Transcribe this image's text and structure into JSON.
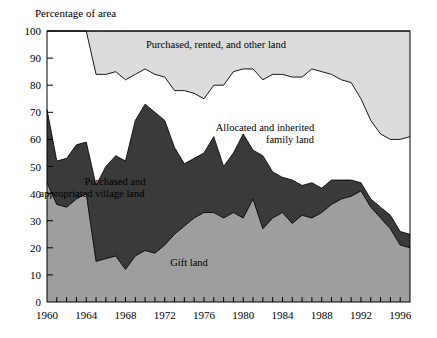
{
  "chart_data": {
    "type": "area",
    "stacked": true,
    "title": "",
    "ylabel": "Percentage of area",
    "xlabel": "",
    "ylim": [
      0,
      100
    ],
    "xlim": [
      1960,
      1997
    ],
    "grid": false,
    "legend_position": "inline-annotations",
    "y_ticks": [
      0,
      10,
      20,
      30,
      40,
      50,
      60,
      70,
      80,
      90,
      100
    ],
    "x_ticks": [
      1960,
      1964,
      1968,
      1972,
      1976,
      1980,
      1984,
      1988,
      1992,
      1996
    ],
    "x_minor_tick_interval": 1,
    "x": [
      1960,
      1961,
      1962,
      1963,
      1964,
      1965,
      1966,
      1967,
      1968,
      1969,
      1970,
      1971,
      1972,
      1973,
      1974,
      1975,
      1976,
      1977,
      1978,
      1979,
      1980,
      1981,
      1982,
      1983,
      1984,
      1985,
      1986,
      1987,
      1988,
      1989,
      1990,
      1991,
      1992,
      1993,
      1994,
      1995,
      1996,
      1997
    ],
    "series": [
      {
        "name": "Gift land",
        "key": "gift_land",
        "color": "#9e9e9e",
        "label_text": "Gift land",
        "values": [
          44,
          36,
          35,
          38,
          40,
          15,
          16,
          17,
          12,
          17,
          19,
          18,
          21,
          25,
          28,
          31,
          33,
          33,
          31,
          33,
          31,
          38,
          27,
          31,
          33,
          29,
          32,
          31,
          33,
          36,
          38,
          39,
          41,
          35,
          31,
          27,
          21,
          20
        ]
      },
      {
        "name": "Purchased and appropriated village land",
        "key": "village_land",
        "color": "#3a3a3a",
        "label_text": "Purchased and\nappropriated village land",
        "values": [
          27,
          16,
          18,
          20,
          19,
          28,
          34,
          37,
          40,
          50,
          54,
          52,
          46,
          32,
          23,
          22,
          22,
          28,
          19,
          22,
          31,
          18,
          27,
          17,
          13,
          16,
          11,
          13,
          9,
          9,
          7,
          6,
          3,
          3,
          4,
          5,
          5,
          5
        ]
      },
      {
        "name": "Allocated and inherited family land",
        "key": "family_land",
        "color": "#ffffff",
        "label_text": "Allocated and inherited\nfamily land",
        "values": [
          29,
          48,
          47,
          42,
          41,
          41,
          34,
          31,
          30,
          17,
          13,
          14,
          16,
          21,
          27,
          24,
          20,
          19,
          30,
          30,
          24,
          30,
          28,
          36,
          38,
          38,
          40,
          42,
          43,
          39,
          37,
          36,
          31,
          29,
          27,
          28,
          34,
          36
        ]
      },
      {
        "name": "Purchased, rented, and other land",
        "key": "other_land",
        "color": "#dcdcdc",
        "label_text": "Purchased, rented, and other land",
        "values": [
          0,
          0,
          0,
          0,
          0,
          16,
          16,
          15,
          18,
          16,
          14,
          16,
          17,
          22,
          22,
          23,
          25,
          20,
          20,
          15,
          14,
          14,
          18,
          16,
          16,
          17,
          17,
          14,
          15,
          16,
          18,
          19,
          25,
          33,
          38,
          40,
          40,
          39
        ]
      }
    ],
    "annotations": [
      {
        "text": "Purchased, rented, and other land",
        "x_px": 216,
        "y_px": 48
      },
      {
        "text": "Allocated and inherited",
        "x_px": 265,
        "y_px": 131
      },
      {
        "text": "family land",
        "x_px": 290,
        "y_px": 143
      },
      {
        "text": "Purchased and",
        "x_px": 115,
        "y_px": 185
      },
      {
        "text": "appropriated village land",
        "x_px": 92,
        "y_px": 197
      },
      {
        "text": "Gift land",
        "x_px": 189,
        "y_px": 266
      }
    ]
  },
  "colors": {
    "gift_land": "#9e9e9e",
    "village_land": "#3a3a3a",
    "family_land": "#ffffff",
    "other_land": "#dcdcdc",
    "axis": "#000000",
    "background": "#ffffff"
  }
}
